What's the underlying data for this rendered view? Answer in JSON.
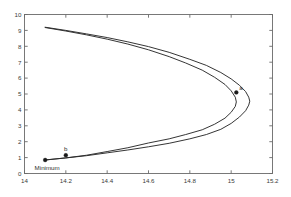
{
  "chart_data": {
    "type": "line",
    "title": "",
    "xlabel": "",
    "ylabel": "",
    "xlim": [
      14,
      15.2
    ],
    "ylim": [
      0,
      10
    ],
    "grid": false,
    "legend": null,
    "xticks": [
      14,
      14.2,
      14.4,
      14.6,
      14.8,
      15,
      15.2
    ],
    "xtick_labels": [
      "14",
      "14.2",
      "14.4",
      "14.6",
      "14.8",
      "15",
      "15.2"
    ],
    "yticks": [
      0,
      1,
      2,
      3,
      4,
      5,
      6,
      7,
      8,
      9,
      10
    ],
    "ytick_labels": [
      "0",
      "1",
      "2",
      "3",
      "4",
      "5",
      "6",
      "7",
      "8",
      "9",
      "10"
    ],
    "series": [
      {
        "name": "outer-branch",
        "x": [
          14.1,
          14.2,
          14.3,
          14.4,
          14.5,
          14.6,
          14.7,
          14.8,
          14.88,
          14.95,
          15.0,
          15.04,
          15.07,
          15.085,
          15.09,
          15.085,
          15.07,
          15.04,
          15.0,
          14.95,
          14.88,
          14.8,
          14.7,
          14.6,
          14.5,
          14.4,
          14.3,
          14.2,
          14.1
        ],
        "y": [
          9.2,
          9.0,
          8.78,
          8.55,
          8.28,
          7.98,
          7.62,
          7.18,
          6.8,
          6.35,
          5.95,
          5.55,
          5.15,
          4.8,
          4.55,
          4.3,
          3.95,
          3.55,
          3.15,
          2.78,
          2.45,
          2.18,
          1.9,
          1.68,
          1.48,
          1.3,
          1.12,
          0.98,
          0.85
        ]
      },
      {
        "name": "inner-branch",
        "x": [
          14.1,
          14.2,
          14.3,
          14.4,
          14.5,
          14.6,
          14.7,
          14.78,
          14.86,
          14.92,
          14.97,
          15.0,
          15.02,
          15.025,
          15.02,
          15.0,
          14.97,
          14.92,
          14.86,
          14.78,
          14.7,
          14.6,
          14.5,
          14.4,
          14.3,
          14.2,
          14.1
        ],
        "y": [
          9.18,
          8.96,
          8.72,
          8.45,
          8.14,
          7.78,
          7.35,
          6.95,
          6.5,
          6.05,
          5.6,
          5.2,
          4.8,
          4.5,
          4.22,
          3.85,
          3.48,
          3.1,
          2.75,
          2.45,
          2.18,
          1.92,
          1.62,
          1.38,
          1.15,
          0.98,
          0.85
        ]
      }
    ],
    "markers": [
      {
        "label": "Minimum",
        "x": 14.1,
        "y": 0.85,
        "label_dx": 2,
        "label_dy": 10,
        "label_anchor": "middle"
      },
      {
        "label": "b",
        "x": 14.2,
        "y": 1.15,
        "label_dx": 0,
        "label_dy": -4,
        "label_anchor": "middle"
      },
      {
        "label": "a",
        "x": 15.025,
        "y": 5.1,
        "label_dx": 3,
        "label_dy": -2,
        "label_anchor": "start"
      }
    ],
    "colors": {
      "curve": "#2a2a2a",
      "axis": "#6b6b6b",
      "marker": "#1a1a1a",
      "background": "#ffffff",
      "tick_text": "#3a3a3a"
    }
  }
}
